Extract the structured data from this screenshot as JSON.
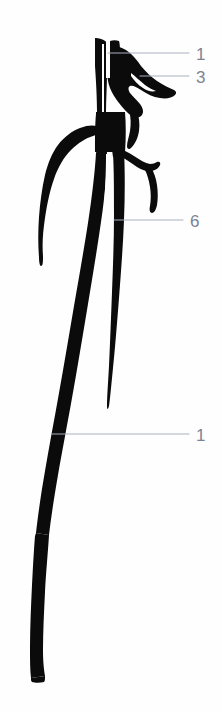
{
  "figure": {
    "background_color": "#fefefe",
    "ink_color": "#0b0b0c",
    "label_color": "#7c8293",
    "leader_color": "#aab0bd",
    "width": 222,
    "height": 712
  },
  "labels": [
    {
      "id": "label-1-top",
      "text": "1",
      "text_x": 196,
      "text_y": 60,
      "leader": {
        "x1": 108,
        "y1": 53,
        "x2": 189,
        "y2": 53
      }
    },
    {
      "id": "label-3",
      "text": "3",
      "text_x": 196,
      "text_y": 83,
      "leader": {
        "x1": 140,
        "y1": 76,
        "x2": 189,
        "y2": 76
      }
    },
    {
      "id": "label-6",
      "text": "6",
      "text_x": 190,
      "text_y": 227,
      "leader": {
        "x1": 114,
        "y1": 220,
        "x2": 183,
        "y2": 220
      }
    },
    {
      "id": "label-1-bottom",
      "text": "1",
      "text_x": 196,
      "text_y": 441,
      "leader": {
        "x1": 52,
        "y1": 434,
        "x2": 189,
        "y2": 434
      }
    }
  ],
  "structures": [
    {
      "id": "main-trunk-left",
      "name": "left-descending-vessel",
      "description": "thick long vessel descending from upper centre to lower left, gently curving"
    },
    {
      "id": "main-trunk-right",
      "name": "right-descending-vessel",
      "description": "vertical vessel from top descending and tapering to a fine point mid-figure"
    },
    {
      "id": "upper-mass",
      "name": "upper-branching-mass",
      "description": "dense branching region at top with lateral projections to the right"
    },
    {
      "id": "left-arching-branch",
      "name": "left-arching-branch",
      "description": "thin branch arching leftward then descending to a fine tip"
    },
    {
      "id": "right-lateral-branch",
      "name": "right-lateral-branch",
      "description": "short branch projecting right-downward, hook shaped"
    },
    {
      "id": "lower-trunk",
      "name": "lower-trunk",
      "description": "thick vessel continuing to bottom of frame, curving slightly"
    }
  ]
}
